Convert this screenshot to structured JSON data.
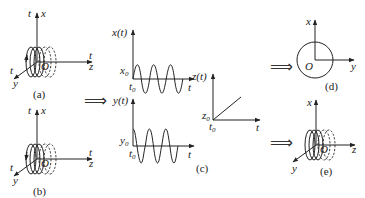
{
  "panels": {
    "a": {
      "caption": "(a)",
      "axis_labels": {
        "x": "x",
        "z": "z",
        "y": "y",
        "origin": "O",
        "t_x": "t",
        "t_z": "t",
        "t_y": "t"
      }
    },
    "b": {
      "caption": "(b)",
      "axis_labels": {
        "x": "x",
        "z": "z",
        "y": "y",
        "origin": "O",
        "t_x": "t",
        "t_z": "t",
        "t_y": "t"
      }
    },
    "c": {
      "caption": "(c)",
      "xt": {
        "ylabel": "x(t)",
        "y0": "x",
        "y0_sub": "0",
        "t0": "t",
        "t0_sub": "0",
        "xlabel": "t"
      },
      "yt": {
        "ylabel": "y(t)",
        "y0": "y",
        "y0_sub": "0",
        "t0": "t",
        "t0_sub": "0",
        "xlabel": "t"
      },
      "zt": {
        "ylabel": "z(t)",
        "y0": "z",
        "y0_sub": "0",
        "t0": "t",
        "t0_sub": "0",
        "xlabel": "t"
      }
    },
    "d": {
      "caption": "(d)",
      "axis_labels": {
        "x": "x",
        "y": "y",
        "origin": "O"
      }
    },
    "e": {
      "caption": "(e)",
      "axis_labels": {
        "x": "x",
        "z": "z",
        "y": "y",
        "origin": "O"
      }
    }
  },
  "arrows": {
    "symbol": "⟹"
  }
}
